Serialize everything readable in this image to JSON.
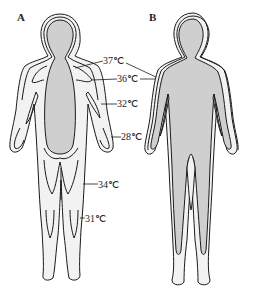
{
  "figure": {
    "panels": [
      {
        "id": "A",
        "label": "A",
        "description": "Body temperature distribution in cold environment"
      },
      {
        "id": "B",
        "label": "B",
        "description": "Body temperature distribution in warm environment"
      }
    ],
    "isotherm_labels": [
      {
        "text": "37℃"
      },
      {
        "text": "36℃"
      },
      {
        "text": "32℃"
      },
      {
        "text": "28℃"
      },
      {
        "text": "34℃"
      },
      {
        "text": "31℃"
      }
    ],
    "colors": {
      "core": "#cfcfcf",
      "shell": "#f2f2f2",
      "outline": "#1a1a1a",
      "background": "#ffffff"
    }
  }
}
